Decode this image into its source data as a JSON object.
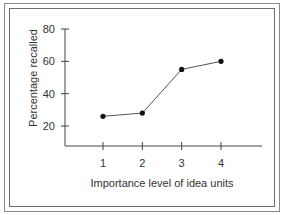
{
  "chart_data": {
    "type": "line",
    "title": "",
    "xlabel": "Importance level of idea units",
    "ylabel": "Percentage recalled",
    "categories": [
      "1",
      "2",
      "3",
      "4"
    ],
    "x": [
      1,
      2,
      3,
      4
    ],
    "values": [
      26,
      28,
      55,
      60
    ],
    "series": [
      {
        "name": "Percentage recalled",
        "values": [
          26,
          28,
          55,
          60
        ]
      }
    ],
    "ylim": [
      10,
      80
    ],
    "yticks": [
      20,
      40,
      60,
      80
    ],
    "xticks": [
      1,
      2,
      3,
      4
    ],
    "grid": false,
    "legend": null,
    "line_color": "#555555",
    "marker_color": "#111111"
  },
  "labels": {
    "xlabel": "Importance level of idea units",
    "ylabel": "Percentage recalled",
    "yticks": [
      "80",
      "60",
      "40",
      "20"
    ],
    "xticks": [
      "1",
      "2",
      "3",
      "4"
    ]
  }
}
